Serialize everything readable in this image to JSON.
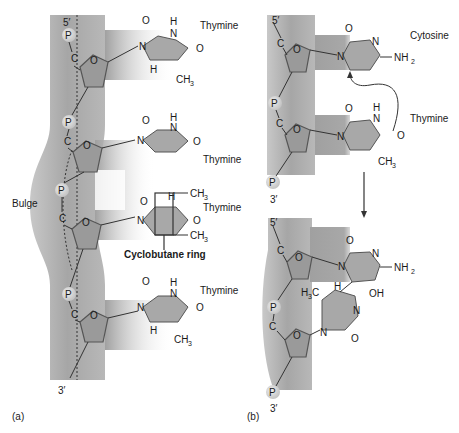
{
  "colors": {
    "backbone": "#b4b4b4",
    "backbone_dark": "#8c8c8c",
    "base_fill": "#a8a8a8",
    "sugar_fill": "#9a9a9a",
    "phosphate": "#d6d6d6",
    "line": "#333333"
  },
  "panel_a": {
    "label": "(a)",
    "end_5": "5′",
    "end_3": "3′",
    "bulge_label": "Bulge",
    "cyclobutane_label": "Cyclobutane ring",
    "bases": [
      {
        "name": "Thymine"
      },
      {
        "name": "Thymine"
      },
      {
        "name": "Thymine"
      },
      {
        "name": "Thymine"
      }
    ],
    "atoms": {
      "O": "O",
      "N": "N",
      "H": "H",
      "CH3": "CH",
      "sub3": "3",
      "P": "P",
      "C": "C"
    }
  },
  "panel_b": {
    "label": "(b)",
    "top": {
      "end_5": "5′",
      "end_3": "3′",
      "bases": [
        {
          "name": "Cytosine"
        },
        {
          "name": "Thymine"
        }
      ],
      "NH2": "NH",
      "sub2": "2"
    },
    "bottom": {
      "end_5": "5′",
      "end_3": "3′",
      "OH": "OH",
      "H3C": "H",
      "H3C_sub": "3",
      "H3C_c": "C"
    }
  }
}
